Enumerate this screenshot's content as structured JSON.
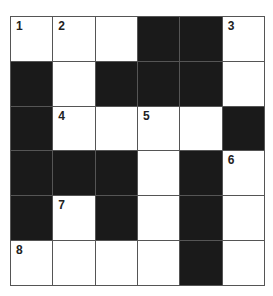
{
  "puzzle": {
    "rows": 6,
    "cols": 6,
    "cells": [
      [
        {
          "b": false,
          "n": "1"
        },
        {
          "b": false,
          "n": "2"
        },
        {
          "b": false,
          "n": ""
        },
        {
          "b": true,
          "n": ""
        },
        {
          "b": true,
          "n": ""
        },
        {
          "b": false,
          "n": "3"
        }
      ],
      [
        {
          "b": true,
          "n": ""
        },
        {
          "b": false,
          "n": ""
        },
        {
          "b": true,
          "n": ""
        },
        {
          "b": true,
          "n": ""
        },
        {
          "b": true,
          "n": ""
        },
        {
          "b": false,
          "n": ""
        }
      ],
      [
        {
          "b": true,
          "n": ""
        },
        {
          "b": false,
          "n": "4"
        },
        {
          "b": false,
          "n": ""
        },
        {
          "b": false,
          "n": "5"
        },
        {
          "b": false,
          "n": ""
        },
        {
          "b": true,
          "n": ""
        }
      ],
      [
        {
          "b": true,
          "n": ""
        },
        {
          "b": true,
          "n": ""
        },
        {
          "b": true,
          "n": ""
        },
        {
          "b": false,
          "n": ""
        },
        {
          "b": true,
          "n": ""
        },
        {
          "b": false,
          "n": "6"
        }
      ],
      [
        {
          "b": true,
          "n": ""
        },
        {
          "b": false,
          "n": "7"
        },
        {
          "b": true,
          "n": ""
        },
        {
          "b": false,
          "n": ""
        },
        {
          "b": true,
          "n": ""
        },
        {
          "b": false,
          "n": ""
        }
      ],
      [
        {
          "b": false,
          "n": "8"
        },
        {
          "b": false,
          "n": ""
        },
        {
          "b": false,
          "n": ""
        },
        {
          "b": false,
          "n": ""
        },
        {
          "b": true,
          "n": ""
        },
        {
          "b": false,
          "n": ""
        }
      ]
    ]
  },
  "colors": {
    "black_cell": "#1a1a1a",
    "white_cell": "#ffffff",
    "grid_line": "#555555"
  }
}
